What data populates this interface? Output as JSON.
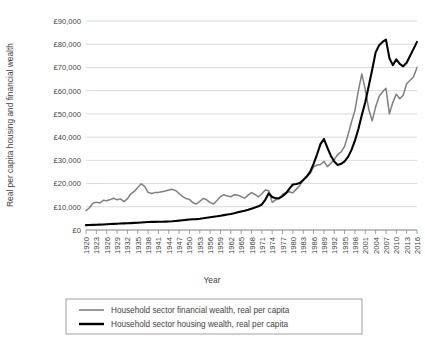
{
  "chart_data": {
    "type": "line",
    "title": "",
    "xlabel": "Year",
    "ylabel": "Real per capita housing and financial wealth",
    "ylim": [
      0,
      90000
    ],
    "ytick_labels": [
      "£0",
      "£10,000",
      "£20,000",
      "£30,000",
      "£40,000",
      "£50,000",
      "£60,000",
      "£70,000",
      "£80,000",
      "£90,000"
    ],
    "ytick_values": [
      0,
      10000,
      20000,
      30000,
      40000,
      50000,
      60000,
      70000,
      80000,
      90000
    ],
    "xlim": [
      1920,
      2016
    ],
    "grid": "horizontal",
    "legend_position": "bottom",
    "xtick_labels": [
      "1920",
      "1923",
      "1926",
      "1929",
      "1932",
      "1935",
      "1938",
      "1941",
      "1944",
      "1947",
      "1950",
      "1953",
      "1956",
      "1959",
      "1962",
      "1965",
      "1968",
      "1971",
      "1974",
      "1977",
      "1980",
      "1983",
      "1986",
      "1989",
      "1992",
      "1995",
      "1998",
      "2001",
      "2004",
      "2007",
      "2010",
      "2013",
      "2016"
    ],
    "x": [
      1920,
      1921,
      1922,
      1923,
      1924,
      1925,
      1926,
      1927,
      1928,
      1929,
      1930,
      1931,
      1932,
      1933,
      1934,
      1935,
      1936,
      1937,
      1938,
      1939,
      1940,
      1941,
      1942,
      1943,
      1944,
      1945,
      1946,
      1947,
      1948,
      1949,
      1950,
      1951,
      1952,
      1953,
      1954,
      1955,
      1956,
      1957,
      1958,
      1959,
      1960,
      1961,
      1962,
      1963,
      1964,
      1965,
      1966,
      1967,
      1968,
      1969,
      1970,
      1971,
      1972,
      1973,
      1974,
      1975,
      1976,
      1977,
      1978,
      1979,
      1980,
      1981,
      1982,
      1983,
      1984,
      1985,
      1986,
      1987,
      1988,
      1989,
      1990,
      1991,
      1992,
      1993,
      1994,
      1995,
      1996,
      1997,
      1998,
      1999,
      2000,
      2001,
      2002,
      2003,
      2004,
      2005,
      2006,
      2007,
      2008,
      2009,
      2010,
      2011,
      2012,
      2013,
      2014,
      2015,
      2016
    ],
    "series": [
      {
        "name": "Household sector financial wealth, real per capita",
        "color": "#7f7f7f",
        "width": 1.5,
        "values": [
          8300,
          9600,
          11500,
          12000,
          11600,
          12800,
          12600,
          13100,
          13700,
          13000,
          13400,
          12200,
          13400,
          15600,
          16600,
          18300,
          19900,
          18800,
          16200,
          15700,
          16100,
          16200,
          16500,
          16800,
          17200,
          17500,
          17000,
          15700,
          14400,
          13600,
          13200,
          11700,
          11200,
          12300,
          13600,
          13000,
          11800,
          11200,
          12700,
          14400,
          15200,
          14600,
          14300,
          15200,
          15000,
          14400,
          13700,
          15000,
          16100,
          15300,
          14300,
          15600,
          17200,
          16900,
          11900,
          13000,
          13300,
          15400,
          16200,
          16500,
          16000,
          17600,
          19200,
          21400,
          22800,
          24300,
          27200,
          28000,
          28200,
          29500,
          27300,
          28700,
          30300,
          32500,
          33600,
          36000,
          41000,
          46500,
          51500,
          60000,
          67200,
          60500,
          52000,
          47000,
          53000,
          57500,
          59500,
          61000,
          50000,
          55000,
          58500,
          56500,
          58000,
          63000,
          64500,
          66000,
          70000
        ]
      },
      {
        "name": "Household sector housing wealth, real per capita",
        "color": "#000000",
        "width": 2.1,
        "values": [
          2100,
          2150,
          2200,
          2250,
          2320,
          2400,
          2480,
          2560,
          2650,
          2720,
          2800,
          2850,
          2900,
          2980,
          3050,
          3150,
          3250,
          3350,
          3450,
          3500,
          3520,
          3540,
          3560,
          3600,
          3650,
          3750,
          3900,
          4050,
          4200,
          4350,
          4500,
          4600,
          4700,
          4850,
          5050,
          5300,
          5500,
          5700,
          5900,
          6150,
          6400,
          6650,
          6900,
          7200,
          7600,
          8000,
          8300,
          8700,
          9200,
          9700,
          10200,
          11000,
          13000,
          15800,
          14200,
          13700,
          13800,
          14500,
          15800,
          17800,
          19600,
          19800,
          20200,
          21500,
          23000,
          25000,
          28500,
          32500,
          37000,
          39200,
          35500,
          32000,
          29500,
          28000,
          28500,
          29500,
          31500,
          34500,
          38500,
          43500,
          49500,
          55000,
          62000,
          69000,
          76500,
          79500,
          81000,
          82000,
          74000,
          71000,
          73500,
          71500,
          70500,
          72000,
          75000,
          78000,
          81000
        ]
      }
    ]
  },
  "legend": {
    "entries": [
      {
        "label": "Household sector financial wealth, real per capita"
      },
      {
        "label": "Household sector housing wealth, real per capita"
      }
    ]
  }
}
